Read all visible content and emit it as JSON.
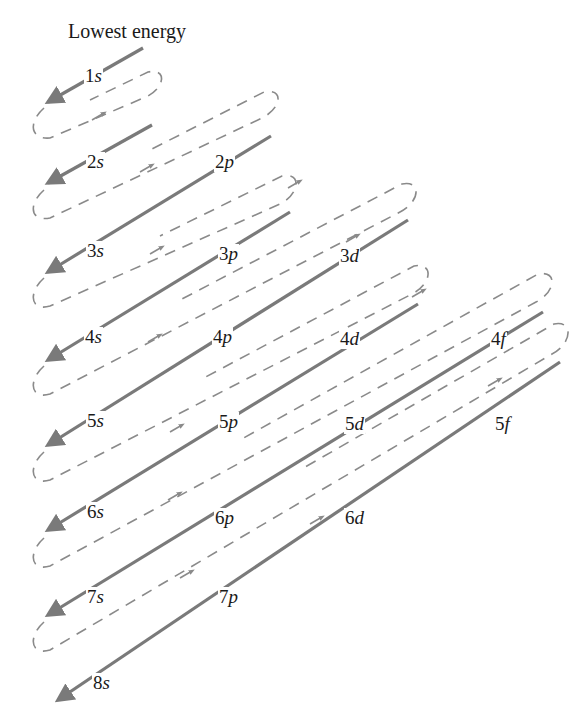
{
  "title": "Lowest energy",
  "colors": {
    "line": "#7a7a7a",
    "dashed": "#8a8a8a",
    "text": "#1a1a1a"
  },
  "orbitals": [
    {
      "n": "1",
      "l": "s",
      "x": 84,
      "y": 66
    },
    {
      "n": "2",
      "l": "s",
      "x": 86,
      "y": 152
    },
    {
      "n": "2",
      "l": "p",
      "x": 214,
      "y": 152
    },
    {
      "n": "3",
      "l": "s",
      "x": 86,
      "y": 241
    },
    {
      "n": "3",
      "l": "p",
      "x": 218,
      "y": 244
    },
    {
      "n": "3",
      "l": "d",
      "x": 339,
      "y": 246
    },
    {
      "n": "4",
      "l": "s",
      "x": 84,
      "y": 327
    },
    {
      "n": "4",
      "l": "p",
      "x": 212,
      "y": 327
    },
    {
      "n": "4",
      "l": "d",
      "x": 339,
      "y": 329
    },
    {
      "n": "4",
      "l": "f",
      "x": 490,
      "y": 329
    },
    {
      "n": "5",
      "l": "s",
      "x": 86,
      "y": 411
    },
    {
      "n": "5",
      "l": "p",
      "x": 218,
      "y": 412
    },
    {
      "n": "5",
      "l": "d",
      "x": 344,
      "y": 414
    },
    {
      "n": "5",
      "l": "f",
      "x": 494,
      "y": 414
    },
    {
      "n": "6",
      "l": "s",
      "x": 86,
      "y": 502
    },
    {
      "n": "6",
      "l": "p",
      "x": 214,
      "y": 508
    },
    {
      "n": "6",
      "l": "d",
      "x": 344,
      "y": 508
    },
    {
      "n": "7",
      "l": "s",
      "x": 86,
      "y": 587
    },
    {
      "n": "7",
      "l": "p",
      "x": 218,
      "y": 587
    },
    {
      "n": "8",
      "l": "s",
      "x": 92,
      "y": 673
    }
  ]
}
